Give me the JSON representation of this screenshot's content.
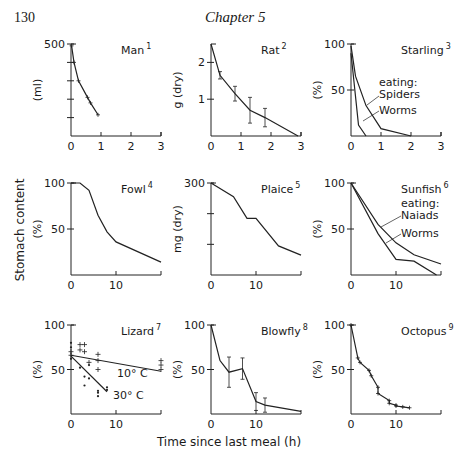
{
  "page": {
    "number": "130",
    "chapter": "Chapter 5"
  },
  "figure": {
    "shared_ylabel": "Stomach content",
    "shared_xlabel": "Time since last meal (h)"
  },
  "chart_data": [
    {
      "type": "line",
      "title": "Man",
      "ref": "1",
      "ylabel": "(ml)",
      "xlim": [
        0,
        3
      ],
      "ylim": [
        0,
        500
      ],
      "xticks": [
        "0",
        "1",
        "2",
        "3"
      ],
      "yticks": [
        {
          "v": 500,
          "label": "500"
        },
        {
          "v": 400,
          "label": ""
        },
        {
          "v": 300,
          "label": ""
        },
        {
          "v": 200,
          "label": ""
        },
        {
          "v": 100,
          "label": ""
        }
      ],
      "series": [
        {
          "name": "Man",
          "x": [
            0.02,
            0.1,
            0.25,
            0.55,
            0.65,
            0.9
          ],
          "y": [
            490,
            400,
            300,
            210,
            180,
            115
          ],
          "markers": "plus"
        }
      ]
    },
    {
      "type": "line",
      "title": "Rat",
      "ref": "2",
      "ylabel": "g (dry)",
      "xlim": [
        0,
        3
      ],
      "ylim": [
        0,
        2.5
      ],
      "xticks": [
        "0",
        "1",
        "2",
        "3"
      ],
      "yticks": [
        {
          "v": 2,
          "label": "2"
        },
        {
          "v": 1,
          "label": "1"
        }
      ],
      "series": [
        {
          "name": "Rat",
          "x": [
            0,
            0.3,
            0.8,
            1.3,
            1.8,
            2.9
          ],
          "y": [
            2.5,
            1.65,
            1.15,
            0.7,
            0.5,
            0
          ],
          "err": [
            0,
            0.1,
            0.2,
            0.35,
            0.25,
            0
          ],
          "markers": "errorbar"
        }
      ]
    },
    {
      "type": "line",
      "title": "Starling",
      "ref": "3",
      "ylabel": "(%)",
      "xlim": [
        0,
        3
      ],
      "ylim": [
        0,
        100
      ],
      "xticks": [
        "0",
        "1",
        "2",
        "3"
      ],
      "yticks": [
        {
          "v": 100,
          "label": "100"
        },
        {
          "v": 50,
          "label": "50"
        }
      ],
      "annotations": [
        "eating:",
        "Spiders",
        "Worms"
      ],
      "series": [
        {
          "name": "Spiders",
          "x": [
            0,
            0.15,
            0.5,
            1,
            2
          ],
          "y": [
            98,
            65,
            33,
            8,
            0
          ]
        },
        {
          "name": "Worms",
          "x": [
            0,
            0.25,
            0.5
          ],
          "y": [
            90,
            12,
            0
          ]
        }
      ]
    },
    {
      "type": "line",
      "title": "Fowl",
      "ref": "4",
      "ylabel": "(%)",
      "xlim": [
        0,
        20
      ],
      "ylim": [
        0,
        100
      ],
      "xticks": [
        "0",
        "10"
      ],
      "yticks": [
        {
          "v": 100,
          "label": "100"
        },
        {
          "v": 50,
          "label": "50"
        }
      ],
      "series": [
        {
          "name": "Fowl",
          "x": [
            0,
            2,
            4,
            6,
            8,
            10,
            20
          ],
          "y": [
            100,
            100,
            92,
            65,
            47,
            36,
            14
          ]
        }
      ]
    },
    {
      "type": "line",
      "title": "Plaice",
      "ref": "5",
      "ylabel": "mg (dry)",
      "xlim": [
        0,
        20
      ],
      "ylim": [
        0,
        300
      ],
      "xticks": [
        "0",
        "10"
      ],
      "yticks": [
        {
          "v": 300,
          "label": "300"
        },
        {
          "v": 200,
          "label": ""
        },
        {
          "v": 100,
          "label": ""
        }
      ],
      "series": [
        {
          "name": "Plaice",
          "x": [
            0,
            5,
            8,
            10,
            15,
            20
          ],
          "y": [
            300,
            255,
            185,
            185,
            95,
            65
          ]
        }
      ]
    },
    {
      "type": "line",
      "title": "Sunfish",
      "ref": "6",
      "ylabel": "(%)",
      "xlim": [
        0,
        20
      ],
      "ylim": [
        0,
        100
      ],
      "xticks": [
        "0",
        "10"
      ],
      "yticks": [
        {
          "v": 100,
          "label": "100"
        },
        {
          "v": 50,
          "label": "50"
        }
      ],
      "annotations": [
        "eating:",
        "Naiads",
        "Worms"
      ],
      "series": [
        {
          "name": "Naiads",
          "x": [
            0,
            6,
            10,
            14,
            20
          ],
          "y": [
            100,
            55,
            35,
            22,
            12
          ]
        },
        {
          "name": "Worms",
          "x": [
            0,
            6,
            10,
            14,
            19
          ],
          "y": [
            100,
            45,
            17,
            15,
            0
          ]
        }
      ]
    },
    {
      "type": "scatter",
      "title": "Lizard",
      "ref": "7",
      "ylabel": "(%)",
      "xlim": [
        0,
        20
      ],
      "ylim": [
        0,
        100
      ],
      "xticks": [
        "0",
        "10"
      ],
      "yticks": [
        {
          "v": 100,
          "label": "100"
        },
        {
          "v": 50,
          "label": "50"
        }
      ],
      "annotations": [
        "10° C",
        "30° C"
      ],
      "series": [
        {
          "name": "10° C",
          "line_x": [
            0,
            20
          ],
          "line_y": [
            66,
            48
          ],
          "points_x": [
            0,
            0,
            2,
            3,
            2,
            3,
            4,
            6,
            6,
            6,
            20,
            20,
            20
          ],
          "points_y": [
            70,
            66,
            78,
            78,
            72,
            70,
            58,
            67,
            60,
            50,
            60,
            55,
            50
          ],
          "marker": "plus"
        },
        {
          "name": "30° C",
          "line_x": [
            0,
            8
          ],
          "line_y": [
            65,
            25
          ],
          "points_x": [
            0,
            0,
            0,
            2,
            3,
            3,
            4,
            4,
            6,
            6,
            6,
            8,
            8
          ],
          "points_y": [
            80,
            75,
            62,
            52,
            42,
            32,
            40,
            55,
            26,
            20,
            24,
            30,
            27
          ],
          "marker": "dot"
        }
      ]
    },
    {
      "type": "line",
      "title": "Blowfly",
      "ref": "8",
      "ylabel": "(%)",
      "xlim": [
        0,
        20
      ],
      "ylim": [
        0,
        100
      ],
      "xticks": [
        "0",
        "10"
      ],
      "yticks": [
        {
          "v": 100,
          "label": "100"
        },
        {
          "v": 50,
          "label": "50"
        }
      ],
      "series": [
        {
          "name": "Blowfly",
          "x": [
            0,
            2,
            4,
            7,
            10,
            12,
            20
          ],
          "y": [
            100,
            60,
            47,
            51,
            14,
            10,
            3
          ],
          "err": [
            0,
            0,
            17,
            12,
            10,
            8,
            0
          ],
          "markers": "errorbar"
        }
      ]
    },
    {
      "type": "line",
      "title": "Octopus",
      "ref": "9",
      "ylabel": "(%)",
      "xlim": [
        0,
        20
      ],
      "ylim": [
        0,
        100
      ],
      "xticks": [
        "0",
        "10"
      ],
      "yticks": [
        {
          "v": 100,
          "label": "100"
        },
        {
          "v": 50,
          "label": "50"
        }
      ],
      "series": [
        {
          "name": "Octopus",
          "x": [
            0,
            1.5,
            2,
            4,
            4.5,
            6,
            6,
            8.5,
            8.5,
            10,
            10,
            11.5,
            13
          ],
          "y": [
            100,
            63,
            58,
            49,
            43,
            30,
            23,
            15,
            12,
            10,
            9,
            8,
            7
          ],
          "markers": "plus"
        }
      ]
    }
  ]
}
